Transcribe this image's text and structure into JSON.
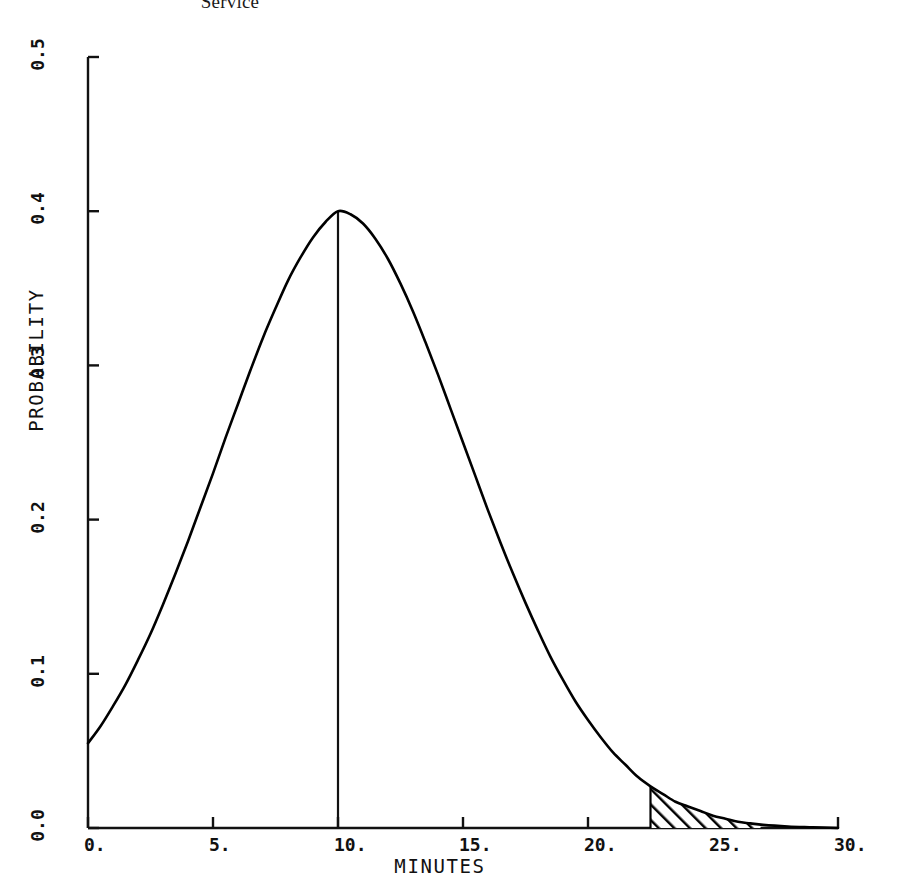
{
  "top_caption": "Service",
  "chart_data": {
    "type": "line",
    "title": "Service",
    "xlabel": "MINUTES",
    "ylabel": "PROBABILITY",
    "xlim": [
      0,
      30
    ],
    "ylim": [
      0.0,
      0.5
    ],
    "grid": false,
    "legend": null,
    "x_ticks": [
      {
        "value": 0,
        "label": "0."
      },
      {
        "value": 5,
        "label": "5."
      },
      {
        "value": 10,
        "label": "10."
      },
      {
        "value": 15,
        "label": "15."
      },
      {
        "value": 20,
        "label": "20."
      },
      {
        "value": 25,
        "label": "25."
      },
      {
        "value": 30,
        "label": "30."
      }
    ],
    "y_ticks": [
      {
        "value": 0.0,
        "label": "0.0"
      },
      {
        "value": 0.1,
        "label": "0.1"
      },
      {
        "value": 0.2,
        "label": "0.2"
      },
      {
        "value": 0.3,
        "label": "0.3"
      },
      {
        "value": 0.4,
        "label": "0.4"
      },
      {
        "value": 0.5,
        "label": "0.5"
      }
    ],
    "series": [
      {
        "name": "probability density",
        "color": "#000000",
        "x": [
          0.0,
          0.5,
          1.0,
          1.5,
          2.0,
          2.5,
          3.0,
          3.5,
          4.0,
          4.5,
          5.0,
          5.5,
          6.0,
          6.5,
          7.0,
          7.5,
          8.0,
          8.5,
          9.0,
          9.5,
          10.0,
          10.5,
          11.0,
          11.5,
          12.0,
          12.5,
          13.0,
          13.5,
          14.0,
          14.5,
          15.0,
          15.5,
          16.0,
          16.5,
          17.0,
          17.5,
          18.0,
          18.5,
          19.0,
          19.5,
          20.0,
          20.5,
          21.0,
          21.5,
          22.0,
          22.5,
          23.0,
          23.5,
          24.0,
          24.5,
          25.0,
          25.5,
          26.0,
          26.5,
          27.0,
          28.0,
          29.0,
          30.0
        ],
        "y": [
          0.055,
          0.066,
          0.079,
          0.093,
          0.109,
          0.126,
          0.145,
          0.165,
          0.186,
          0.208,
          0.23,
          0.253,
          0.275,
          0.297,
          0.318,
          0.337,
          0.355,
          0.37,
          0.383,
          0.393,
          0.4,
          0.398,
          0.392,
          0.382,
          0.369,
          0.353,
          0.335,
          0.315,
          0.294,
          0.272,
          0.25,
          0.228,
          0.206,
          0.185,
          0.165,
          0.146,
          0.128,
          0.111,
          0.096,
          0.082,
          0.07,
          0.059,
          0.049,
          0.041,
          0.033,
          0.027,
          0.022,
          0.017,
          0.014,
          0.011,
          0.008,
          0.006,
          0.004,
          0.003,
          0.002,
          0.001,
          0.0005,
          0.0
        ]
      }
    ],
    "annotations": [
      {
        "type": "vline",
        "name": "mean-marker",
        "x": 10.0,
        "y_from": 0.0,
        "y_to": 0.4
      },
      {
        "type": "hatched_region",
        "name": "upper-tail-shading",
        "x_from": 22.5,
        "x_to": 26.9,
        "note": "tail area under curve, diagonal hatching, bounded left by vertical line"
      }
    ]
  },
  "colors": {
    "ink": "#111111",
    "curve": "#000000",
    "background": "#ffffff"
  }
}
